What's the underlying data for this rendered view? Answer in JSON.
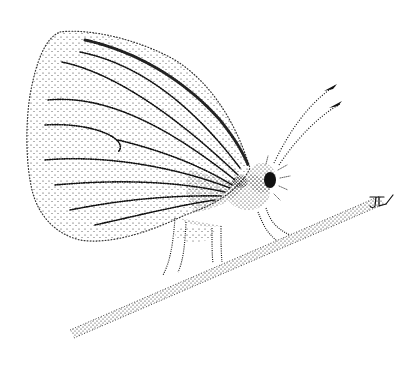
{
  "image": {
    "subject": "Stipple ink illustration of a butterfly perched on a twig",
    "style": "black stipple dots on white",
    "signature": "JFL",
    "colors": {
      "ink": "#111111",
      "paper": "#ffffff"
    }
  }
}
